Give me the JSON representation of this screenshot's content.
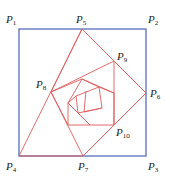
{
  "diagram": {
    "type": "nested-rotating-squares",
    "colors": {
      "square": "#4a63b8",
      "spiral": "#e05a5a"
    },
    "square": [
      [
        19,
        29
      ],
      [
        146,
        29
      ],
      [
        146,
        156
      ],
      [
        19,
        156
      ]
    ],
    "polygons": [
      [
        [
          82,
          29
        ],
        [
          146,
          93
        ],
        [
          83,
          156
        ],
        [
          19,
          156
        ],
        [
          82,
          29
        ]
      ],
      [
        [
          82,
          29
        ],
        [
          51,
          92
        ],
        [
          83,
          156
        ]
      ],
      [
        [
          51,
          92
        ],
        [
          114,
          61
        ],
        [
          114,
          125
        ],
        [
          83,
          156
        ]
      ],
      [
        [
          114,
          61
        ],
        [
          146,
          93
        ],
        [
          114,
          125
        ]
      ],
      [
        [
          51,
          92
        ],
        [
          68,
          125
        ],
        [
          114,
          125
        ],
        [
          114,
          93
        ],
        [
          82,
          79
        ],
        [
          51,
          92
        ]
      ],
      [
        [
          82,
          79
        ],
        [
          68,
          103
        ],
        [
          68,
          125
        ]
      ],
      [
        [
          82,
          79
        ],
        [
          99,
          87
        ],
        [
          114,
          93
        ]
      ],
      [
        [
          68,
          103
        ],
        [
          90,
          125
        ]
      ],
      [
        [
          68,
          103
        ],
        [
          78,
          113
        ],
        [
          102,
          108
        ],
        [
          99,
          87
        ],
        [
          76,
          96
        ],
        [
          68,
          103
        ]
      ],
      [
        [
          76,
          96
        ],
        [
          78,
          113
        ]
      ],
      [
        [
          86,
          91
        ],
        [
          84,
          112
        ]
      ],
      [
        [
          84,
          112
        ],
        [
          102,
          108
        ]
      ]
    ],
    "labels": [
      {
        "id": "P1",
        "base": "P",
        "sub": "1",
        "x": 6,
        "y": 14
      },
      {
        "id": "P2",
        "base": "P",
        "sub": "2",
        "x": 148,
        "y": 14
      },
      {
        "id": "P5",
        "base": "P",
        "sub": "5",
        "x": 76,
        "y": 14
      },
      {
        "id": "P9",
        "base": "P",
        "sub": "9",
        "x": 117,
        "y": 51
      },
      {
        "id": "P8",
        "base": "P",
        "sub": "8",
        "x": 36,
        "y": 79
      },
      {
        "id": "P6",
        "base": "P",
        "sub": "6",
        "x": 150,
        "y": 88
      },
      {
        "id": "P10",
        "base": "P",
        "sub": "10",
        "x": 116,
        "y": 127
      },
      {
        "id": "P4",
        "base": "P",
        "sub": "4",
        "x": 6,
        "y": 161
      },
      {
        "id": "P7",
        "base": "P",
        "sub": "7",
        "x": 78,
        "y": 161
      },
      {
        "id": "P3",
        "base": "P",
        "sub": "3",
        "x": 148,
        "y": 161
      }
    ]
  }
}
